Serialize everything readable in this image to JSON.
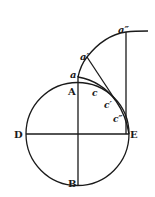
{
  "diagram": {
    "type": "geometric construction",
    "circle": {
      "center": [
        77.5,
        134
      ],
      "radius": 51.5
    },
    "colors": {
      "stroke": "#1a1a1a",
      "background": "#ffffff"
    },
    "labels": {
      "A": "A",
      "B": "B",
      "D": "D",
      "E": "E",
      "a": "a",
      "a1": "a′",
      "a2": "a″",
      "c": "c",
      "c1": "c′",
      "c2": "c″"
    }
  }
}
